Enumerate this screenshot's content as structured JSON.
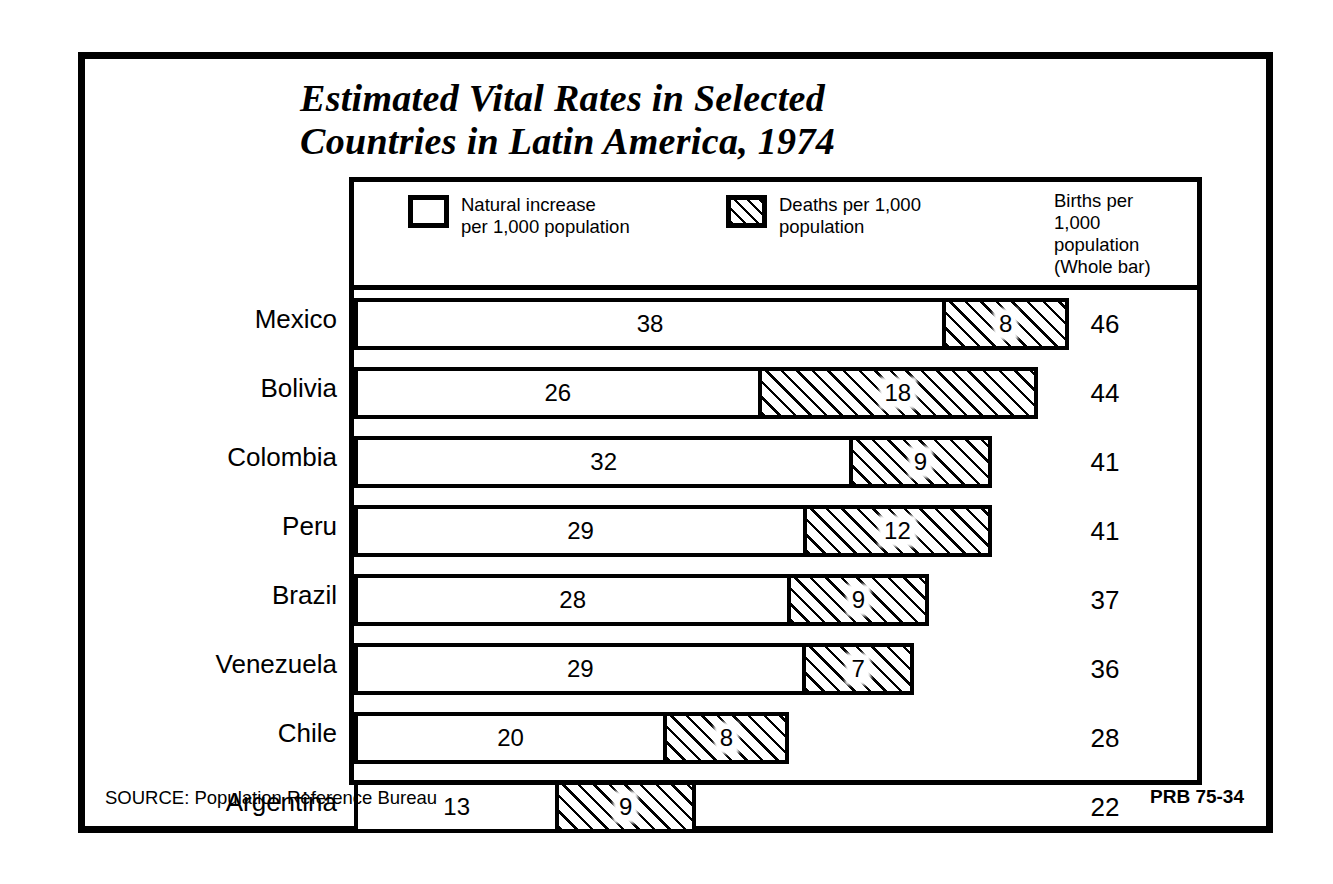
{
  "title": {
    "line1": "Estimated Vital Rates in Selected",
    "line2": "Countries in Latin America, 1974"
  },
  "legend": {
    "entries": [
      {
        "swatch": "open-square",
        "label": "Natural increase\nper 1,000 population"
      },
      {
        "swatch": "hatched-square",
        "label": "Deaths per 1,000\npopulation"
      }
    ],
    "right_header": "Births per\n1,000\npopulation\n(Whole bar)"
  },
  "footer": {
    "source": "SOURCE: Population Reference Bureau",
    "code": "PRB 75-34"
  },
  "colors": {
    "ink": "#000000",
    "paper": "#ffffff"
  },
  "chart_data": {
    "type": "bar",
    "orientation": "horizontal",
    "stacked": true,
    "title": "Estimated Vital Rates in Selected Countries in Latin America, 1974",
    "xlabel": "",
    "ylabel": "",
    "xlim": [
      0,
      46
    ],
    "grid": false,
    "legend_position": "top",
    "categories": [
      "Mexico",
      "Bolivia",
      "Colombia",
      "Peru",
      "Brazil",
      "Venezuela",
      "Chile",
      "Argentina"
    ],
    "series": [
      {
        "name": "Natural increase per 1,000 population",
        "fill": "open",
        "values": [
          38,
          26,
          32,
          29,
          28,
          29,
          20,
          13
        ]
      },
      {
        "name": "Deaths per 1,000 population",
        "fill": "hatched",
        "values": [
          8,
          18,
          9,
          12,
          9,
          7,
          8,
          9
        ]
      }
    ],
    "totals_label": "Births per 1,000 population (Whole bar)",
    "totals": [
      46,
      44,
      41,
      41,
      37,
      36,
      28,
      22
    ],
    "rows": [
      {
        "country": "Mexico",
        "natural_increase": 38,
        "deaths": 8,
        "births": 46
      },
      {
        "country": "Bolivia",
        "natural_increase": 26,
        "deaths": 18,
        "births": 44
      },
      {
        "country": "Colombia",
        "natural_increase": 32,
        "deaths": 9,
        "births": 41
      },
      {
        "country": "Peru",
        "natural_increase": 29,
        "deaths": 12,
        "births": 41
      },
      {
        "country": "Brazil",
        "natural_increase": 28,
        "deaths": 9,
        "births": 37
      },
      {
        "country": "Venezuela",
        "natural_increase": 29,
        "deaths": 7,
        "births": 36
      },
      {
        "country": "Chile",
        "natural_increase": 20,
        "deaths": 8,
        "births": 28
      },
      {
        "country": "Argentina",
        "natural_increase": 13,
        "deaths": 9,
        "births": 22
      }
    ]
  }
}
